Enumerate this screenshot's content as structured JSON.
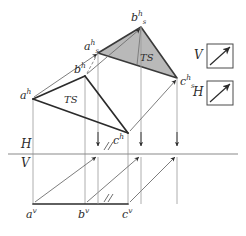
{
  "figure": {
    "background": "#ffffff",
    "ink_color": "#2b2b2b",
    "thin_color": "#8a8a8a",
    "shade_fill": "#b9b9b9",
    "shade_stroke": "#3a3a3a"
  },
  "labels": {
    "a_h": {
      "base": "a",
      "sup": "h"
    },
    "b_h": {
      "base": "b",
      "sup": "h"
    },
    "c_h": {
      "base": "c",
      "sup": "h"
    },
    "a_v": {
      "base": "a",
      "sup": "v"
    },
    "b_v": {
      "base": "b",
      "sup": "v"
    },
    "c_v": {
      "base": "c",
      "sup": "v"
    },
    "a_sh": {
      "base": "a",
      "sup": "h",
      "sub": "s"
    },
    "b_sh": {
      "base": "b",
      "sup": "h",
      "sub": "s"
    },
    "c_sh": {
      "base": "c",
      "sup": "h",
      "sub": "s"
    },
    "ts_left": "TS",
    "ts_right": "TS",
    "plane_h": "H",
    "plane_v": "V",
    "box_v_label": "V",
    "box_h_label": "H"
  },
  "geometry": {
    "ground_line": {
      "x1": 8,
      "y1": 154,
      "x2": 238,
      "y2": 154
    },
    "points": {
      "a_h": {
        "x": 33,
        "y": 99
      },
      "b_h": {
        "x": 85,
        "y": 76
      },
      "c_h": {
        "x": 128,
        "y": 133
      },
      "a_sh": {
        "x": 98,
        "y": 53
      },
      "b_sh": {
        "x": 141,
        "y": 27
      },
      "c_sh": {
        "x": 177,
        "y": 78
      },
      "a_v": {
        "x": 33,
        "y": 204
      },
      "b_v": {
        "x": 85,
        "y": 204
      },
      "c_v": {
        "x": 128,
        "y": 204
      }
    },
    "triangle_top_shaded": [
      "a_sh",
      "b_sh",
      "c_sh"
    ],
    "triangle_front": [
      "a_h",
      "b_h",
      "c_h"
    ],
    "translation_arrows": [
      {
        "from": "a_h",
        "to": "a_sh"
      },
      {
        "from": "b_h",
        "to": "b_sh"
      },
      {
        "from": "c_h",
        "to": "c_sh"
      },
      {
        "from": "a_v",
        "to": "a_h_upper"
      },
      {
        "from": "b_v",
        "to": "b_h_upper"
      },
      {
        "from": "c_v",
        "to": "c_h_upper"
      }
    ],
    "tick_marks": [
      {
        "x": 106,
        "y": 146,
        "count": 2
      },
      {
        "x": 106,
        "y": 197,
        "count": 2
      }
    ]
  },
  "boxes": {
    "v_box": {
      "x": 207,
      "y": 44,
      "w": 26,
      "h": 24,
      "arrow": "diagonal-up-right"
    },
    "h_box": {
      "x": 207,
      "y": 81,
      "w": 26,
      "h": 24,
      "arrow": "diagonal-up-right"
    }
  }
}
